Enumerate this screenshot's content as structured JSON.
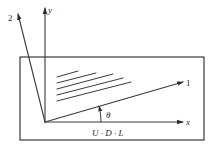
{
  "diagram": {
    "colors": {
      "stroke": "#3a3a3a",
      "text": "#2a2a2a",
      "background": "#ffffff"
    },
    "labels": {
      "axis_y": "y",
      "axis_x": "x",
      "axis_1": "1",
      "axis_2": "2",
      "angle": "θ",
      "ply_label": "U · D · L"
    },
    "box": {
      "x": 20,
      "y": 57,
      "width": 184,
      "height": 83
    },
    "origin": {
      "x": 45,
      "y": 122
    }
  }
}
